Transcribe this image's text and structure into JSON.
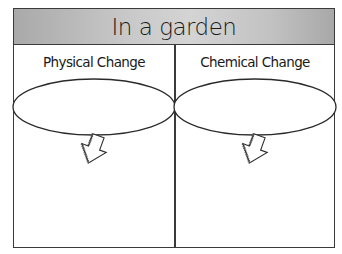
{
  "worksheet": {
    "title": "In a garden",
    "columns": [
      {
        "label": "Physical Change"
      },
      {
        "label": "Chemical Change"
      }
    ]
  }
}
